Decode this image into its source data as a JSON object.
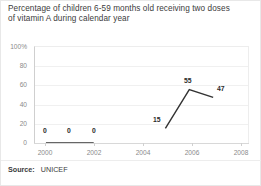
{
  "chart_data": {
    "type": "line",
    "title": "Percentage of children 6-59 months old receiving two doses of vitamin A during calendar year",
    "title_line1": "Percentage of children 6-59 months old receiving two doses",
    "title_line2": "of vitamin A during calendar year",
    "xlabel": "",
    "ylabel": "",
    "x": [
      2000,
      2001,
      2002,
      2005,
      2006,
      2007
    ],
    "values": [
      0,
      0,
      0,
      15,
      55,
      47
    ],
    "point_labels": [
      "0",
      "0",
      "0",
      "15",
      "55",
      "47"
    ],
    "series": [
      {
        "name": "Vitamin A coverage",
        "x": [
          2000,
          2001,
          2002,
          2005,
          2006,
          2007
        ],
        "values": [
          0,
          0,
          0,
          15,
          55,
          47
        ],
        "color": "#333333",
        "segments": [
          {
            "x": [
              2000,
              2001,
              2002
            ],
            "values": [
              0,
              0,
              0
            ]
          },
          {
            "x": [
              2005,
              2006,
              2007
            ],
            "values": [
              15,
              55,
              47
            ]
          }
        ]
      }
    ],
    "xlim": [
      1999.5,
      2008.5
    ],
    "ylim": [
      0,
      100
    ],
    "xticks": [
      2000,
      2002,
      2004,
      2006,
      2008
    ],
    "xtick_labels": [
      "2000",
      "2002",
      "2004",
      "2006",
      "2008"
    ],
    "yticks": [
      0,
      20,
      40,
      60,
      80,
      100
    ],
    "ytick_labels": [
      "0",
      "20",
      "40",
      "60",
      "80",
      "100%"
    ],
    "grid": "horizontal",
    "legend": "none",
    "line_color": "#333333",
    "gridline_color": "#f0f0f0",
    "axis_color": "#cfcfcf",
    "tick_label_color": "#8a8a8a",
    "label_text_color": "#2a2a2a"
  },
  "source": {
    "label": "Source:",
    "value": "UNICEF"
  }
}
